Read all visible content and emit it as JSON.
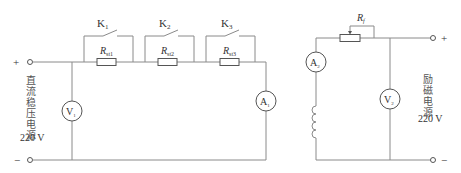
{
  "left_circuit": {
    "source_label_chars": [
      "直",
      "流",
      "稳",
      "压",
      "电",
      "源"
    ],
    "source_voltage": "220 V",
    "plus_sign": "+",
    "minus_sign": "−",
    "voltmeter": {
      "letter": "V",
      "sub": "1"
    },
    "ammeter": {
      "letter": "A",
      "sub": "1"
    },
    "switches": [
      {
        "letter": "K",
        "sub": "1"
      },
      {
        "letter": "K",
        "sub": "2"
      },
      {
        "letter": "K",
        "sub": "3"
      }
    ],
    "resistors": [
      {
        "letter": "R",
        "sub": "st1"
      },
      {
        "letter": "R",
        "sub": "st2"
      },
      {
        "letter": "R",
        "sub": "st3"
      }
    ]
  },
  "right_circuit": {
    "source_label_chars": [
      "励",
      "磁",
      "电",
      "源"
    ],
    "source_voltage": "220 V",
    "plus_sign": "+",
    "minus_sign": "−",
    "ammeter": {
      "letter": "A",
      "sub": "2"
    },
    "voltmeter": {
      "letter": "V",
      "sub": "2"
    },
    "rheostat": {
      "letter": "R",
      "sub": "f"
    },
    "inductor": "field-winding"
  },
  "colors": {
    "wire": "#8a8a8a",
    "component": "#555555",
    "text": "#333333"
  }
}
